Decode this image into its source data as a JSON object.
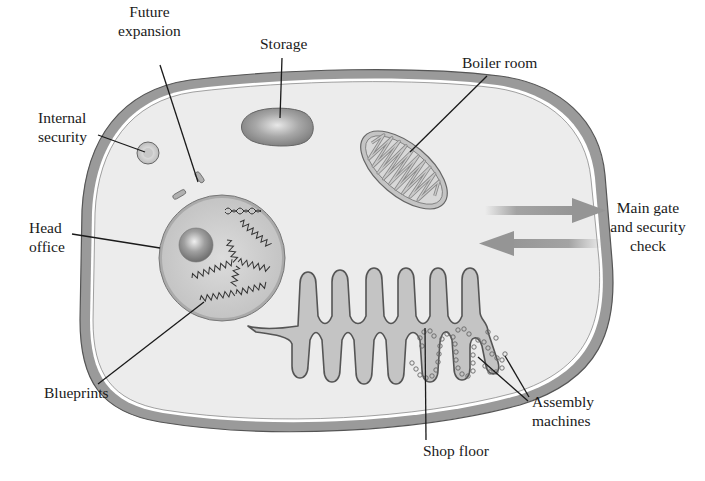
{
  "diagram": {
    "colors": {
      "membrane": "#9a9a9a",
      "membrane_edge": "#555555",
      "cytoplasm": "#ececec",
      "organelle": "#bdbdbd",
      "organelle_dark": "#8c8c8c",
      "line": "#1a1a1a",
      "arrow": "#a3a3a3"
    },
    "labels": {
      "future_expansion": [
        "Future",
        "expansion"
      ],
      "storage": [
        "Storage"
      ],
      "boiler_room": [
        "Boiler room"
      ],
      "internal_security": [
        "Internal",
        "security"
      ],
      "head_office": [
        "Head",
        "office"
      ],
      "main_gate": [
        "Main gate",
        "and security",
        "check"
      ],
      "blueprints": [
        "Blueprints"
      ],
      "assembly_machines": [
        "Assembly",
        "machines"
      ],
      "shop_floor": [
        "Shop floor"
      ]
    },
    "structures": [
      {
        "name": "cell-membrane",
        "analogy": ""
      },
      {
        "name": "vacuole",
        "analogy": "Storage"
      },
      {
        "name": "mitochondrion",
        "analogy": "Boiler room"
      },
      {
        "name": "lysosome",
        "analogy": "Internal security"
      },
      {
        "name": "centrioles",
        "analogy": "Future expansion"
      },
      {
        "name": "nucleus",
        "analogy": "Head office"
      },
      {
        "name": "dna",
        "analogy": "Blueprints"
      },
      {
        "name": "endoplasmic-reticulum",
        "analogy": "Shop floor"
      },
      {
        "name": "ribosomes",
        "analogy": "Assembly machines"
      },
      {
        "name": "transport-arrows",
        "analogy": "Main gate and security check"
      }
    ]
  }
}
